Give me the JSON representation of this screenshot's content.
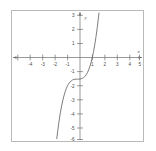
{
  "figure": {
    "name": "cubic-function-graph",
    "background_color": "#ffffff",
    "frame_color": "#b9b9b9",
    "axis_color": "#6d6d6d",
    "curve_color": "#666666"
  },
  "chart_data": {
    "type": "line",
    "title": "",
    "subtitle": "",
    "xlabel": "x",
    "ylabel": "y",
    "xlim": [
      -5.3,
      5.3
    ],
    "ylim": [
      -6.9,
      3.4
    ],
    "grid": false,
    "legend": null,
    "x_ticks": [
      -5,
      -4,
      -3,
      -2,
      -1,
      1,
      2,
      3,
      4,
      5
    ],
    "x_tick_labels": [
      "",
      "-4",
      "-3",
      "-2",
      "-1",
      "1",
      "2",
      "3",
      "4",
      "5"
    ],
    "y_ticks": [
      3,
      2,
      1,
      -1,
      -2,
      -3,
      -4,
      -5,
      -6
    ],
    "y_tick_labels": [
      "3",
      "2",
      "1",
      "-1",
      "-2",
      "-3",
      "-4",
      "-5",
      "-6"
    ],
    "series": [
      {
        "name": "y = x^3 - 2",
        "equation": "y = x^3 - 2",
        "x": [
          -1.68,
          -1.6,
          -1.5,
          -1.4,
          -1.3,
          -1.2,
          -1.1,
          -1.0,
          -0.9,
          -0.8,
          -0.7,
          -0.6,
          -0.5,
          -0.4,
          -0.3,
          -0.2,
          -0.1,
          0.0,
          0.1,
          0.2,
          0.3,
          0.4,
          0.5,
          0.6,
          0.7,
          0.8,
          0.9,
          1.0,
          1.1,
          1.2,
          1.26,
          1.3,
          1.4,
          1.5,
          1.6,
          1.7,
          1.74
        ],
        "y": [
          -6.74,
          -6.1,
          -5.38,
          -4.74,
          -4.2,
          -3.73,
          -3.33,
          -3.0,
          -2.73,
          -2.51,
          -2.34,
          -2.22,
          -2.13,
          -2.06,
          -2.03,
          -2.01,
          -2.0,
          -2.0,
          -2.0,
          -1.99,
          -1.97,
          -1.94,
          -1.88,
          -1.78,
          -1.66,
          -1.49,
          -1.27,
          -1.0,
          -0.67,
          -0.27,
          0.0,
          0.2,
          0.74,
          1.38,
          2.1,
          2.91,
          3.27
        ],
        "x_intercept": 1.26,
        "y_intercept": -2,
        "inflection_point": [
          0,
          -2
        ]
      }
    ],
    "annotations": []
  }
}
